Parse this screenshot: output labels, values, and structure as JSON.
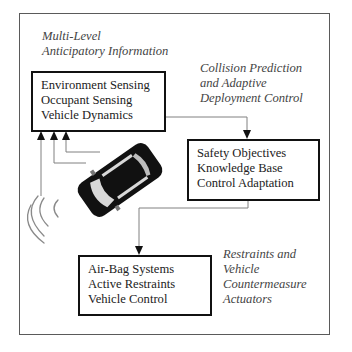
{
  "diagram": {
    "title_caption": {
      "lines": [
        "Multi-Level",
        " Anticipatory Information"
      ]
    },
    "prediction_caption": {
      "lines": [
        "Collision Prediction",
        " and  Adaptive",
        " Deployment Control"
      ]
    },
    "actuators_caption": {
      "lines": [
        "Restraints and",
        "Vehicle",
        " Countermeasure",
        "Actuators"
      ]
    },
    "boxes": [
      {
        "id": "sensing",
        "lines": [
          "Environment Sensing",
          "Occupant Sensing",
          "Vehicle Dynamics"
        ]
      },
      {
        "id": "decision",
        "lines": [
          "Safety Objectives",
          "Knowledge Base",
          "Control Adaptation"
        ]
      },
      {
        "id": "actuation",
        "lines": [
          "Air-Bag Systems",
          "Active Restraints",
          "Vehicle Control"
        ]
      }
    ],
    "icons": {
      "vehicle": "car-top-view-icon",
      "sensor_waves": "radar-waves-icon"
    },
    "colors": {
      "box_border": "#111111",
      "frame_border": "#5a5a5a",
      "connector": "#808080",
      "text": "#222222",
      "caption_text": "#444444"
    }
  }
}
